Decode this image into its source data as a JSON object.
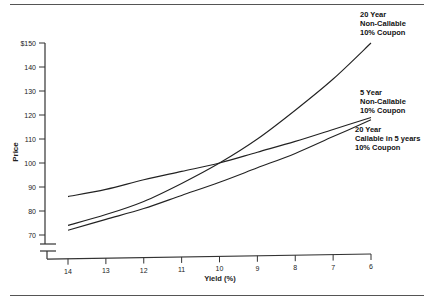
{
  "chart_data": {
    "type": "line",
    "title": "",
    "xlabel": "Yield (%)",
    "ylabel": "Price",
    "x_reversed": true,
    "xlim": [
      14,
      6
    ],
    "ylim": [
      65,
      150
    ],
    "y_axis_break": true,
    "grid": false,
    "x": [
      14,
      13,
      12,
      11,
      10,
      9,
      8,
      7,
      6
    ],
    "x_tick_labels": [
      "14",
      "13",
      "12",
      "11",
      "10",
      "9",
      "8",
      "7",
      "6"
    ],
    "y_tick_labels": [
      "$150",
      "140",
      "130",
      "120",
      "110",
      "100",
      "90",
      "80",
      "70"
    ],
    "y_ticks": [
      150,
      140,
      130,
      120,
      110,
      100,
      90,
      80,
      70
    ],
    "series": [
      {
        "name": "20 Year Non-Callable 10% Coupon",
        "label_lines": [
          "20 Year",
          "Non-Callable",
          "10% Coupon"
        ],
        "values": [
          74,
          78.5,
          84,
          91.5,
          100,
          110,
          122,
          135,
          150
        ]
      },
      {
        "name": "5 Year Non-Callable 10% Coupon",
        "label_lines": [
          "5 Year",
          "Non-Callable",
          "10% Coupon"
        ],
        "values": [
          86,
          89,
          93,
          96.5,
          100,
          104.5,
          109,
          114,
          119
        ]
      },
      {
        "name": "20 Year Callable in 5 years 10% Coupon",
        "label_lines": [
          "20 Year",
          "Callable in 5 years",
          "10% Coupon"
        ],
        "values": [
          72,
          76.5,
          81,
          86.5,
          92,
          98,
          104,
          111,
          118
        ]
      }
    ],
    "legend_position": "right (inline labels)"
  },
  "colors": {
    "line": "#222222",
    "axis": "#333333",
    "text": "#222222",
    "rule": "#555555"
  }
}
